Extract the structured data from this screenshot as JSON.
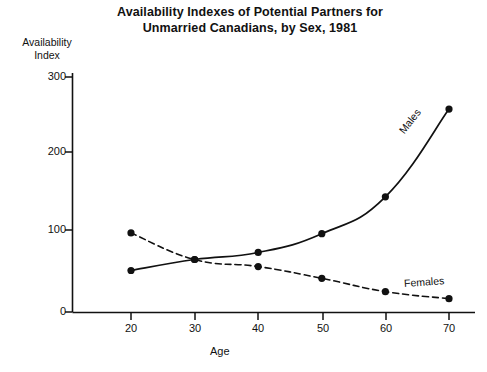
{
  "chart_data": {
    "type": "line",
    "title": "Availability Indexes of Potential Partners for Unmarried Canadians, by Sex, 1981",
    "title_line1": "Availability Indexes of Potential Partners for",
    "title_line2": "Unmarried Canadians, by Sex, 1981",
    "xlabel": "Age",
    "ylabel": "Availability Index",
    "ylabel_line1": "Availability",
    "ylabel_line2": "Index",
    "x": [
      20,
      30,
      40,
      50,
      60,
      70
    ],
    "xticks": [
      "20",
      "30",
      "40",
      "50",
      "60",
      "70"
    ],
    "yticks": [
      "0",
      "100",
      "200",
      "300"
    ],
    "ylim": [
      0,
      300
    ],
    "xlim": [
      15,
      75
    ],
    "grid": false,
    "legend_position": "inline-annotation",
    "series": [
      {
        "name": "Males",
        "label": "Males",
        "values": [
          53,
          67,
          76,
          100,
          147,
          259
        ],
        "style": "solid",
        "color": "#111111",
        "marker": "filled-circle"
      },
      {
        "name": "Females",
        "label": "Females",
        "values": [
          101,
          67,
          58,
          43,
          26,
          17
        ],
        "style": "dashed",
        "color": "#111111",
        "marker": "filled-circle"
      }
    ],
    "annotations": [
      {
        "text": "Males",
        "x": 66,
        "y": 200
      },
      {
        "text": "Females",
        "x": 64,
        "y": 38
      }
    ]
  }
}
